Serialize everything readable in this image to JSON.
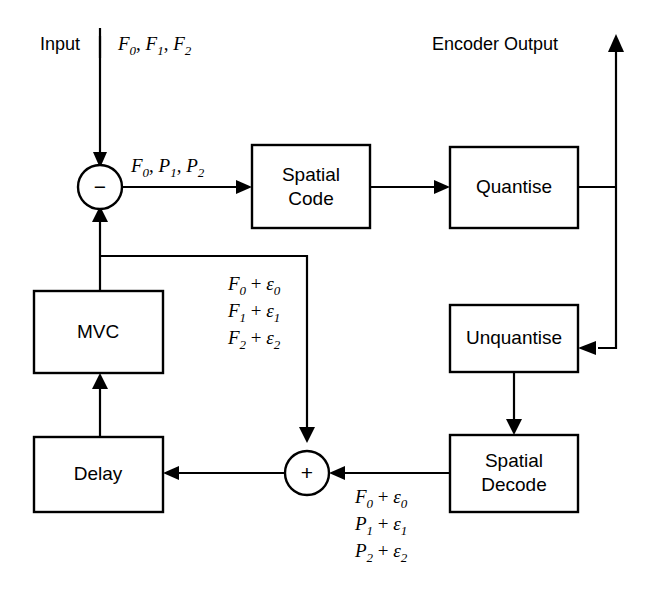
{
  "diagram": {
    "background_color": "#ffffff",
    "line_color": "#000000",
    "blocks": [
      {
        "id": "spatial_code",
        "label_line1": "Spatial",
        "label_line2": "Code"
      },
      {
        "id": "quantise",
        "label_line1": "Quantise",
        "label_line2": ""
      },
      {
        "id": "unquantise",
        "label_line1": "Unquantise",
        "label_line2": ""
      },
      {
        "id": "spatial_decode",
        "label_line1": "Spatial",
        "label_line2": "Decode"
      },
      {
        "id": "mvc",
        "label_line1": "MVC",
        "label_line2": ""
      },
      {
        "id": "delay",
        "label_line1": "Delay",
        "label_line2": ""
      }
    ],
    "nodes": [
      {
        "id": "subtractor",
        "symbol": "−"
      },
      {
        "id": "adder",
        "symbol": "+"
      }
    ],
    "labels": {
      "input": "Input",
      "encoder_output": "Encoder Output",
      "input_signal": {
        "terms": [
          "F0",
          "F1",
          "F2"
        ],
        "separator": ", "
      },
      "predicted_signal": {
        "terms": [
          "F0",
          "P1",
          "P2"
        ],
        "separator": ", "
      },
      "feedback_upper": {
        "lines": [
          {
            "base": "F",
            "base_sub": "0",
            "op": "+",
            "greek": "ε",
            "greek_sub": "0"
          },
          {
            "base": "F",
            "base_sub": "1",
            "op": "+",
            "greek": "ε",
            "greek_sub": "1"
          },
          {
            "base": "F",
            "base_sub": "2",
            "op": "+",
            "greek": "ε",
            "greek_sub": "2"
          }
        ]
      },
      "feedback_lower": {
        "lines": [
          {
            "base": "F",
            "base_sub": "0",
            "op": "+",
            "greek": "ε",
            "greek_sub": "0"
          },
          {
            "base": "P",
            "base_sub": "1",
            "op": "+",
            "greek": "ε",
            "greek_sub": "1"
          },
          {
            "base": "P",
            "base_sub": "2",
            "op": "+",
            "greek": "ε",
            "greek_sub": "2"
          }
        ]
      },
      "signal_terms": {
        "t0": {
          "base": "F",
          "sub": "0"
        },
        "t1": {
          "base": "F",
          "sub": "1"
        },
        "t2": {
          "base": "F",
          "sub": "2"
        },
        "p0": {
          "base": "F",
          "sub": "0"
        },
        "p1": {
          "base": "P",
          "sub": "1"
        },
        "p2": {
          "base": "P",
          "sub": "2"
        }
      }
    }
  }
}
